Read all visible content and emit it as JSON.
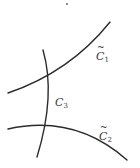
{
  "diagram": {
    "title": "",
    "curves": [
      {
        "id": "c1-tilde",
        "label": "C",
        "subscript": "1",
        "tilde": "~",
        "path": "M 8 93 Q 70 72 110 22"
      },
      {
        "id": "c3",
        "label": "C",
        "subscript": "3",
        "tilde": "",
        "path": "M 43 50 Q 56 95 37 157"
      },
      {
        "id": "c2-tilde",
        "label": "C",
        "subscript": "2",
        "tilde": "~",
        "path": "M 8 129 Q 75 114 127 160"
      }
    ],
    "labels": {
      "c1": {
        "main": "C",
        "sub": "1",
        "tilde": "~"
      },
      "c3": {
        "main": "C",
        "sub": "3"
      },
      "c2": {
        "main": "C",
        "sub": "2",
        "tilde": "~"
      }
    },
    "dot": {
      "x": 67,
      "y": 4
    },
    "colors": {
      "stroke": "#2b2b2b",
      "text": "#3a3a3a",
      "background": "#ffffff"
    }
  }
}
